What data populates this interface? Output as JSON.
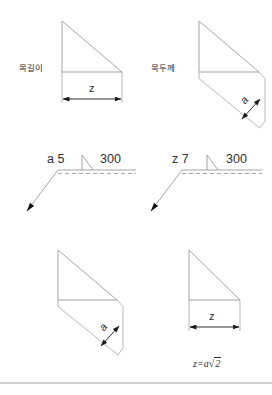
{
  "figure": {
    "type": "technical-drawing",
    "background": "#ffffff",
    "line_color": "#9a9a9a",
    "dim_color": "#1a1a1a",
    "text_color": "#2f2f2f",
    "width": 272,
    "height": 395
  },
  "panels": [
    {
      "id": "top-left",
      "label": "목길이",
      "label_meaning": "leg-length",
      "dimension_symbol": "z",
      "shape": "right-triangle"
    },
    {
      "id": "top-right",
      "label": "목두께",
      "label_meaning": "throat-thickness",
      "dimension_symbol": "a",
      "shape": "right-triangle"
    },
    {
      "id": "middle-left",
      "weld_symbol_size": "a 5",
      "weld_symbol_length": "300",
      "symbol_glyph": "fillet-weld-triangle"
    },
    {
      "id": "middle-right",
      "weld_symbol_size": "z 7",
      "weld_symbol_length": "300",
      "symbol_glyph": "fillet-weld-triangle"
    },
    {
      "id": "bottom-left",
      "dimension_symbol": "a",
      "shape": "right-triangle"
    },
    {
      "id": "bottom-right",
      "dimension_symbol": "z",
      "shape": "right-triangle"
    }
  ],
  "formula": {
    "lhs": "z",
    "equals": "=",
    "coefficient": "a",
    "radical": "√",
    "radicand": "2",
    "full": "z = a√2"
  }
}
